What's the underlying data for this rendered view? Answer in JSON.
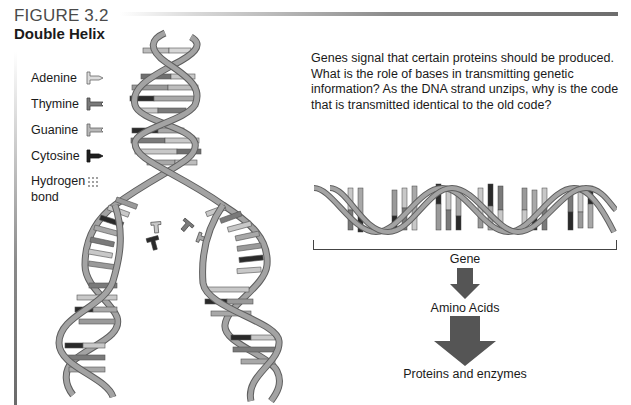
{
  "figure": {
    "label": "FIGURE 3.2",
    "title": "Double Helix"
  },
  "legend": {
    "items": [
      {
        "label": "Adenine",
        "icon": "adenine-base-icon",
        "color": "#c8c8c8"
      },
      {
        "label": "Thymine",
        "icon": "thymine-base-icon",
        "color": "#7a7a7a"
      },
      {
        "label": "Guanine",
        "icon": "guanine-base-icon",
        "color": "#a6a6a6"
      },
      {
        "label": "Cytosine",
        "icon": "cytosine-base-icon",
        "color": "#2a2a2a"
      }
    ],
    "hydrogen_bond": {
      "line1": "Hydrogen",
      "line2": "bond",
      "icon": "hydrogen-bond-dots-icon"
    }
  },
  "question": {
    "text": "Genes signal that certain proteins should be produced. What is the role of bases in transmitting genetic information? As the DNA strand unzips, why is the code that is transmitted identical to the old code?"
  },
  "flow": {
    "gene_label": "Gene",
    "step2_label": "Amino Acids",
    "step3_label": "Proteins and enzymes",
    "arrow_color": "#555555"
  },
  "colors": {
    "strand": "#9a9a9a",
    "strand_edge": "#5e5e5e",
    "adenine": "#c8c8c8",
    "thymine": "#7a7a7a",
    "guanine": "#a6a6a6",
    "cytosine": "#2a2a2a"
  }
}
